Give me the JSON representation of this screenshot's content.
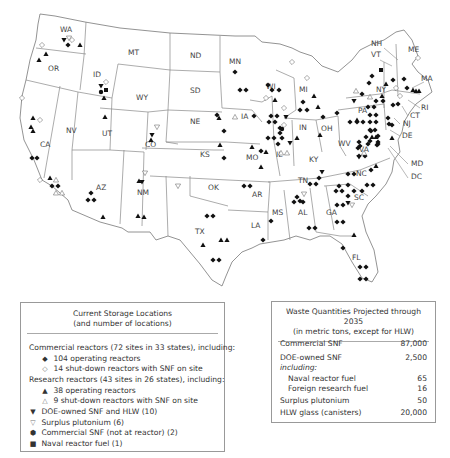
{
  "map": {
    "state_labels": [
      {
        "abbr": "WA",
        "x": 60,
        "y": 32
      },
      {
        "abbr": "OR",
        "x": 48,
        "y": 71
      },
      {
        "abbr": "CA",
        "x": 40,
        "y": 147
      },
      {
        "abbr": "NV",
        "x": 66,
        "y": 133
      },
      {
        "abbr": "ID",
        "x": 93,
        "y": 77
      },
      {
        "abbr": "MT",
        "x": 128,
        "y": 55
      },
      {
        "abbr": "WY",
        "x": 136,
        "y": 100
      },
      {
        "abbr": "UT",
        "x": 102,
        "y": 136
      },
      {
        "abbr": "AZ",
        "x": 96,
        "y": 190
      },
      {
        "abbr": "CO",
        "x": 145,
        "y": 147
      },
      {
        "abbr": "NM",
        "x": 137,
        "y": 195
      },
      {
        "abbr": "ND",
        "x": 197,
        "y": 58
      },
      {
        "abbr": "SD",
        "x": 193,
        "y": 93
      },
      {
        "abbr": "NE",
        "x": 195,
        "y": 124
      },
      {
        "abbr": "KS",
        "x": 202,
        "y": 157
      },
      {
        "abbr": "OK",
        "x": 210,
        "y": 190
      },
      {
        "abbr": "TX",
        "x": 195,
        "y": 234
      },
      {
        "abbr": "MN",
        "x": 235,
        "y": 64
      },
      {
        "abbr": "IA",
        "x": 243,
        "y": 116
      },
      {
        "abbr": "MO",
        "x": 246,
        "y": 160
      },
      {
        "abbr": "AR",
        "x": 253,
        "y": 196
      },
      {
        "abbr": "LA",
        "x": 254,
        "y": 228
      },
      {
        "abbr": "WI",
        "x": 267,
        "y": 88
      },
      {
        "abbr": "IL",
        "x": 280,
        "y": 157
      },
      {
        "abbr": "MI",
        "x": 301,
        "y": 90
      },
      {
        "abbr": "IN",
        "x": 301,
        "y": 128
      },
      {
        "abbr": "OH",
        "x": 324,
        "y": 128
      },
      {
        "abbr": "KY",
        "x": 313,
        "y": 162
      },
      {
        "abbr": "TN",
        "x": 301,
        "y": 181
      },
      {
        "abbr": "MS",
        "x": 277,
        "y": 215
      },
      {
        "abbr": "AL",
        "x": 302,
        "y": 215
      },
      {
        "abbr": "GA",
        "x": 328,
        "y": 215
      },
      {
        "abbr": "FL",
        "x": 355,
        "y": 260
      },
      {
        "abbr": "SC",
        "x": 357,
        "y": 198
      },
      {
        "abbr": "NC",
        "x": 362,
        "y": 175
      },
      {
        "abbr": "WV",
        "x": 343,
        "y": 146
      },
      {
        "abbr": "VA",
        "x": 362,
        "y": 152
      },
      {
        "abbr": "PA",
        "x": 360,
        "y": 113
      },
      {
        "abbr": "NY",
        "x": 380,
        "y": 92
      },
      {
        "abbr": "NH",
        "x": 374,
        "y": 45
      },
      {
        "abbr": "VT",
        "x": 372,
        "y": 57
      },
      {
        "abbr": "ME",
        "x": 410,
        "y": 52
      },
      {
        "abbr": "MA",
        "x": 428,
        "y": 80
      },
      {
        "abbr": "RI",
        "x": 422,
        "y": 110
      },
      {
        "abbr": "CT",
        "x": 411,
        "y": 118
      },
      {
        "abbr": "NJ",
        "x": 404,
        "y": 126
      },
      {
        "abbr": "DE",
        "x": 404,
        "y": 138
      },
      {
        "abbr": "MD",
        "x": 412,
        "y": 167
      },
      {
        "abbr": "DC",
        "x": 412,
        "y": 180
      }
    ]
  },
  "legend": {
    "title_line1": "Current Storage Locations",
    "title_line2": "(and number of locations)",
    "commercial_header": "Commercial reactors (72 sites in 33 states), including:",
    "commercial_operating": "104 operating reactors",
    "commercial_shutdown": "14 shut-down reactors with SNF on site",
    "research_header": "Research reactors (43 sites in 26 states), including:",
    "research_operating": "38 operating reactors",
    "research_shutdown": "9 shut-down reactors with SNF on site",
    "doe": "DOE-owned SNF and HLW (10)",
    "plutonium": "Surplus plutonium (6)",
    "commercial_snf": "Commercial SNF (not at reactor) (2)",
    "naval": "Naval reactor fuel (1)",
    "symbols": {
      "commercial_operating": "filled-diamond-icon",
      "commercial_shutdown": "open-diamond-icon",
      "research_operating": "filled-triangle-icon",
      "research_shutdown": "open-triangle-icon",
      "doe": "filled-down-triangle-icon",
      "plutonium": "open-down-triangle-icon",
      "commercial_snf": "filled-hexagon-icon",
      "naval": "filled-square-icon"
    }
  },
  "quantities": {
    "title_line1": "Waste Quantities Projected through 2035",
    "title_line2": "(in metric tons, except for HLW)",
    "rows": [
      {
        "label": "Commercial SNF",
        "value": "87,000"
      },
      {
        "label": "DOE-owned SNF",
        "value": "2,500"
      },
      {
        "label": "including:",
        "value": ""
      },
      {
        "label": "Naval reactor fuel",
        "value": "65"
      },
      {
        "label": "Foreign research fuel",
        "value": "16"
      },
      {
        "label": "Surplus plutonium",
        "value": "50"
      },
      {
        "label": "HLW glass (canisters)",
        "value": "20,000"
      }
    ]
  }
}
